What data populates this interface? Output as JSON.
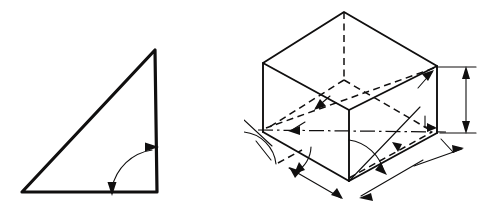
{
  "sheet": {
    "title": "Technical drawing figure pair",
    "background_color": "#ffffff",
    "ink_color": "#100f0f",
    "width": 488,
    "height": 215,
    "panel_count": 2
  },
  "figures": [
    {
      "id": "right-triangle",
      "name": "Right triangle with included angle arrow",
      "type": "2d-line-drawing",
      "description": "Filled-outline right triangle, right angle at lower right, with a double-headed curved arc sweeping between the horizontal base and the vertical side.",
      "line_weight": "thick",
      "vertices": [
        {
          "label": "apex",
          "x": 155,
          "y": 50
        },
        {
          "label": "lower-right",
          "x": 157,
          "y": 192
        },
        {
          "label": "lower-left",
          "x": 22,
          "y": 192
        }
      ],
      "annotations": [
        {
          "kind": "angle-arc",
          "name": "included-angle-arc",
          "arrowheads": "both",
          "start_point": {
            "x": 112,
            "y": 192
          },
          "end_point": {
            "x": 157,
            "y": 148
          },
          "sweep_radius": 46
        }
      ]
    },
    {
      "id": "isometric-box",
      "name": "Axonometric box with dimension and angle annotations",
      "type": "3d-axonometric-line-drawing",
      "description": "Rectangular prism drawn in axonometric projection. Visible solid edges for the top face and front-left and front-right side faces, hidden dashed edges for the rear vertical edge and rear base edges, a dash-dot centre line through the mid height, a vertical height dimension at the right with arrowheads at both ends, angled dimension lines offset below the two front base edges with arrowheads, and several leader arrows and angle arcs marking projection angles.",
      "line_weights": [
        "medium",
        "thin",
        "hairline"
      ],
      "vertices": [
        {
          "label": "top-back",
          "x": 344,
          "y": 12
        },
        {
          "label": "top-left",
          "x": 263,
          "y": 63
        },
        {
          "label": "top-right",
          "x": 437,
          "y": 66
        },
        {
          "label": "top-front",
          "x": 349,
          "y": 110
        },
        {
          "label": "base-left",
          "x": 263,
          "y": 130
        },
        {
          "label": "base-right",
          "x": 437,
          "y": 133
        },
        {
          "label": "base-front",
          "x": 349,
          "y": 181
        },
        {
          "label": "base-back-hidden",
          "x": 344,
          "y": 78
        }
      ],
      "annotations": [
        {
          "kind": "height-dimension",
          "name": "right-height-dimension",
          "orientation": "vertical",
          "arrowheads": "both",
          "x": 465,
          "y_top": 68,
          "y_bottom": 135
        },
        {
          "kind": "linear-dimension",
          "name": "left-base-dimension",
          "orientation": "oblique-left",
          "arrowheads": "both"
        },
        {
          "kind": "linear-dimension",
          "name": "right-base-dimension",
          "orientation": "oblique-right",
          "arrowheads": "both"
        },
        {
          "kind": "angle-arc",
          "name": "front-vertex-angle-arc",
          "arrowheads": "single",
          "vertex": {
            "x": 349,
            "y": 181
          }
        },
        {
          "kind": "angle-arc",
          "name": "left-vertex-angle-arc",
          "arrowheads": "single",
          "vertex": {
            "x": 263,
            "y": 130
          }
        },
        {
          "kind": "leader-arrow",
          "name": "top-right-leader-arrow"
        },
        {
          "kind": "leader-arrow",
          "name": "upper-diagonal-leader-arrow"
        },
        {
          "kind": "leader-arrow",
          "name": "centre-line-leader-arrow"
        },
        {
          "kind": "leader-arrow",
          "name": "right-base-leader-arrow"
        },
        {
          "kind": "centre-line",
          "name": "horizontal-centre-line",
          "style": "dash-dot"
        }
      ]
    }
  ]
}
